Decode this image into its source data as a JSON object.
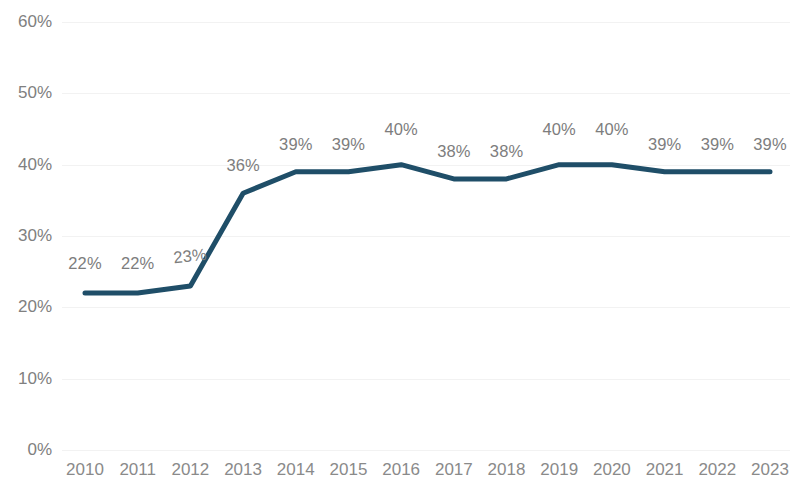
{
  "chart_data": {
    "type": "line",
    "title": "",
    "xlabel": "",
    "ylabel": "",
    "categories": [
      "2010",
      "2011",
      "2012",
      "2013",
      "2014",
      "2015",
      "2016",
      "2017",
      "2018",
      "2019",
      "2020",
      "2021",
      "2022",
      "2023"
    ],
    "values": [
      22,
      22,
      23,
      36,
      39,
      39,
      40,
      38,
      38,
      40,
      40,
      39,
      39,
      39
    ],
    "data_labels": [
      "22%",
      "22%",
      "23%",
      "36%",
      "39%",
      "39%",
      "40%",
      "38%",
      "38%",
      "40%",
      "40%",
      "39%",
      "39%",
      "39%"
    ],
    "ylim": [
      0,
      60
    ],
    "y_ticks": [
      0,
      10,
      20,
      30,
      40,
      50,
      60
    ],
    "y_tick_labels": [
      "0%",
      "10%",
      "20%",
      "30%",
      "40%",
      "50%",
      "60%"
    ],
    "grid": true,
    "grid_axis": "y",
    "legend": "none",
    "series": [
      {
        "name": "series-1",
        "values": [
          22,
          22,
          23,
          36,
          39,
          39,
          40,
          38,
          38,
          40,
          40,
          39,
          39,
          39
        ]
      }
    ],
    "colors": {
      "line": "#1f4e68",
      "grid": "#f2f2f2",
      "axis_text": "#808080",
      "data_label_text": "#7d7d7d",
      "background": "#ffffff"
    },
    "line_width_px": 5
  }
}
